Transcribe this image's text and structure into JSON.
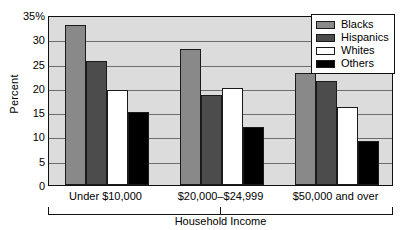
{
  "chart_data": {
    "type": "bar",
    "title": "",
    "xlabel": "Household Income",
    "ylabel": "Percent",
    "categories": [
      "Under $10,000",
      "$20,000–$24,999",
      "$50,000 and over"
    ],
    "series": [
      {
        "name": "Blacks",
        "color": "#898989",
        "values": [
          33.0,
          28.0,
          23.0
        ]
      },
      {
        "name": "Hispanics",
        "color": "#4c4c4c",
        "values": [
          25.5,
          18.5,
          21.5
        ]
      },
      {
        "name": "Whites",
        "color": "#ffffff",
        "values": [
          19.5,
          20.0,
          16.0
        ]
      },
      {
        "name": "Others",
        "color": "#000000",
        "values": [
          15.0,
          12.0,
          9.0
        ]
      }
    ],
    "ylim": [
      0,
      35
    ],
    "ytick_values": [
      35,
      30,
      25,
      20,
      15,
      10,
      5,
      0
    ],
    "ytick_labels": [
      "35%",
      "30",
      "25",
      "20",
      "15",
      "10",
      "5",
      "0"
    ],
    "grid": true,
    "legend_position": "top-right",
    "plot_background": "#dcdcdc"
  },
  "legend": {
    "entries": [
      {
        "label": "Blacks"
      },
      {
        "label": "Hispanics"
      },
      {
        "label": "Whites"
      },
      {
        "label": "Others"
      }
    ]
  },
  "axis": {
    "y_title": "Percent",
    "x_bracket_label": "Household Income"
  }
}
